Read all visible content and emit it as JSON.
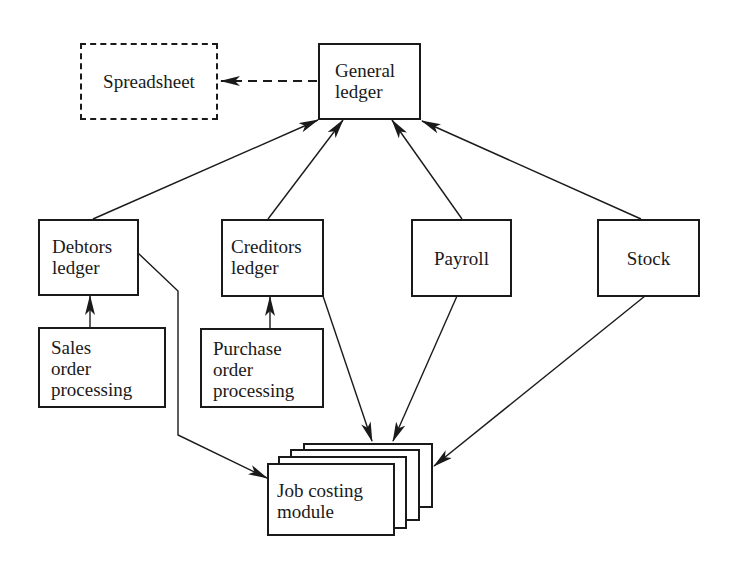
{
  "diagram": {
    "type": "system-data-flow",
    "nodes": {
      "spreadsheet": {
        "label": "Spreadsheet",
        "style": "dashed"
      },
      "general_ledger": {
        "label": "General\nledger"
      },
      "debtors_ledger": {
        "label": "Debtors\nledger"
      },
      "creditors_ledger": {
        "label": "Creditors\nledger"
      },
      "payroll": {
        "label": "Payroll"
      },
      "stock": {
        "label": "Stock"
      },
      "sales_order_processing": {
        "label": "Sales\norder\nprocessing"
      },
      "purchase_order_processing": {
        "label": "Purchase\norder\nprocessing"
      },
      "job_costing_module": {
        "label": "Job costing\nmodule",
        "style": "stacked"
      }
    },
    "edges": [
      {
        "from": "general_ledger",
        "to": "spreadsheet",
        "style": "dashed"
      },
      {
        "from": "debtors_ledger",
        "to": "general_ledger",
        "style": "solid"
      },
      {
        "from": "creditors_ledger",
        "to": "general_ledger",
        "style": "solid"
      },
      {
        "from": "payroll",
        "to": "general_ledger",
        "style": "solid"
      },
      {
        "from": "stock",
        "to": "general_ledger",
        "style": "solid"
      },
      {
        "from": "sales_order_processing",
        "to": "debtors_ledger",
        "style": "solid"
      },
      {
        "from": "purchase_order_processing",
        "to": "creditors_ledger",
        "style": "solid"
      },
      {
        "from": "debtors_ledger",
        "to": "job_costing_module",
        "style": "solid"
      },
      {
        "from": "creditors_ledger",
        "to": "job_costing_module",
        "style": "solid"
      },
      {
        "from": "payroll",
        "to": "job_costing_module",
        "style": "solid"
      },
      {
        "from": "stock",
        "to": "job_costing_module",
        "style": "solid"
      }
    ],
    "colors": {
      "ink": "#1a1a1a",
      "background": "#ffffff"
    }
  }
}
